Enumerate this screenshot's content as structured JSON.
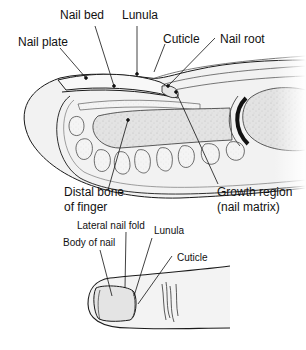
{
  "cross_section": {
    "title": "Fingernail cross-section",
    "labels": {
      "nail_bed": "Nail bed",
      "lunula": "Lunula",
      "nail_plate": "Nail plate",
      "cuticle": "Cuticle",
      "nail_root": "Nail root",
      "distal_bone_line1": "Distal bone",
      "distal_bone_line2": "of finger",
      "growth_region_line1": "Growth region",
      "growth_region_line2": "(nail matrix)"
    }
  },
  "exterior_view": {
    "title": "Fingertip exterior view",
    "labels": {
      "lateral_nail_fold": "Lateral nail fold",
      "lunula": "Lunula",
      "body_of_nail": "Body of nail",
      "cuticle": "Cuticle"
    }
  },
  "colors": {
    "line": "#1a1a1a",
    "tissue": "#efefef",
    "bone": "#d9d9d9",
    "fat": "#f7f7f7"
  }
}
